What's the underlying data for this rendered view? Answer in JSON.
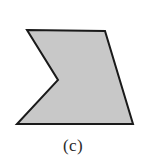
{
  "figure": {
    "caption": "(c)",
    "background_color": "#ffffff",
    "shape": {
      "name": "concave-polygon",
      "label": "chevron-notched-quadrilateral",
      "fill_color": "#c8c8c8",
      "stroke_color": "#1a1a1a",
      "stroke_width": 2,
      "vertex_count": 5,
      "points": "27,30 105,31 133,124 17,124 58,80",
      "vertices": [
        {
          "name": "top-left",
          "x": 27,
          "y": 30
        },
        {
          "name": "top-right",
          "x": 105,
          "y": 31
        },
        {
          "name": "bottom-right",
          "x": 133,
          "y": 124
        },
        {
          "name": "bottom-left",
          "x": 17,
          "y": 124
        },
        {
          "name": "notch-apex",
          "x": 58,
          "y": 80
        }
      ]
    }
  }
}
